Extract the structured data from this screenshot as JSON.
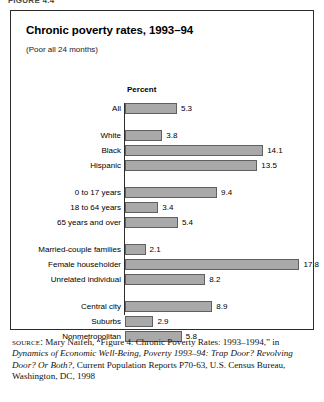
{
  "figure": {
    "caption_stub": "FIGURE 4.4",
    "title": "Chronic poverty rates, 1993–94",
    "subtitle": "(Poor all 24 months)"
  },
  "source": {
    "label": "source:",
    "text_part1": " Mary Naifeh, “Figure 4. Chronic Poverty Rates: 1993–1994,” in ",
    "italic_part": "Dynamics of Economic Well-Being, Poverty 1993–94: Trap Door? Revolving Door? Or Both?",
    "text_part2": ", Current Population Reports P70-63, U.S. Census Bureau, Washington, DC, 1998"
  },
  "chart_data": {
    "type": "bar",
    "orientation": "horizontal",
    "title": "Chronic poverty rates, 1993–94",
    "subtitle": "(Poor all 24 months)",
    "xlabel": "Percent",
    "ylabel": "",
    "xlim": [
      0,
      19.4
    ],
    "grid": false,
    "legend": false,
    "bar_color": "#a9a9a9",
    "bar_border_color": "#606060",
    "groups": [
      {
        "name": "overall",
        "categories": [
          "All"
        ],
        "values": [
          5.3
        ]
      },
      {
        "name": "race-ethnicity",
        "categories": [
          "White",
          "Black",
          "Hispanic"
        ],
        "values": [
          3.8,
          14.1,
          13.5
        ]
      },
      {
        "name": "age",
        "categories": [
          "0 to 17 years",
          "18 to 64 years",
          "65 years and over"
        ],
        "values": [
          9.4,
          3.4,
          5.4
        ]
      },
      {
        "name": "family-type",
        "categories": [
          "Married-couple families",
          "Female householder",
          "Unrelated individual"
        ],
        "values": [
          2.1,
          17.8,
          8.2
        ]
      },
      {
        "name": "residence",
        "categories": [
          "Central city",
          "Suburbs",
          "Nonmetropolitan"
        ],
        "values": [
          8.9,
          2.9,
          5.8
        ]
      }
    ],
    "categories": [
      "All",
      "White",
      "Black",
      "Hispanic",
      "0 to 17 years",
      "18 to 64 years",
      "65 years and over",
      "Married-couple families",
      "Female householder",
      "Unrelated individual",
      "Central city",
      "Suburbs",
      "Nonmetropolitan"
    ],
    "values": [
      5.3,
      3.8,
      14.1,
      13.5,
      9.4,
      3.4,
      5.4,
      2.1,
      17.8,
      8.2,
      8.9,
      2.9,
      5.8
    ],
    "value_labels": [
      "5.3",
      "3.8",
      "14.1",
      "13.5",
      "9.4",
      "3.4",
      "5.4",
      "2.1",
      "17.8",
      "8.2",
      "8.9",
      "2.9",
      "5.8"
    ]
  },
  "layout": {
    "px_per_unit": 9.8,
    "row_height": 11,
    "row_gap": 4,
    "group_gap": 12
  }
}
